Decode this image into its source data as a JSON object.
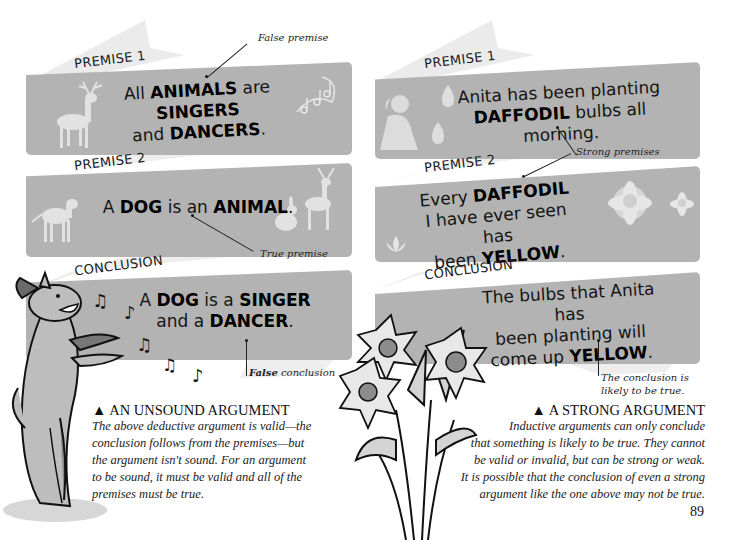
{
  "left": {
    "premise1": {
      "label": "PREMISE 1",
      "text_parts": [
        "All ",
        "ANIMALS",
        " are ",
        "SINGERS",
        "and ",
        "DANCERS",
        "."
      ],
      "annotation": "False premise"
    },
    "premise2": {
      "label": "PREMISE 2",
      "text_parts": [
        "A ",
        "DOG",
        " is an ",
        "ANIMAL",
        "."
      ],
      "annotation": "True premise"
    },
    "conclusion": {
      "label": "CONCLUSION",
      "text_parts": [
        "A ",
        "DOG",
        " is a ",
        "SINGER",
        "and a ",
        "DANCER",
        "."
      ],
      "annotation_bold": "False",
      "annotation_rest": " conclusion"
    },
    "caption": {
      "title": "▲ AN UNSOUND ARGUMENT",
      "lines": [
        "The above deductive argument is valid—the",
        "conclusion follows from the premises—but",
        "the argument isn't sound. For an argument",
        "to be sound, it must be valid and all of the",
        "premises must be true."
      ]
    }
  },
  "right": {
    "premise1": {
      "label": "PREMISE 1",
      "text_parts": [
        "Anita has been planting",
        "DAFFODIL",
        " bulbs all morning."
      ]
    },
    "premise2": {
      "label": "PREMISE 2",
      "text_parts": [
        "Every ",
        "DAFFODIL",
        "I have ever seen has",
        "been ",
        "YELLOW",
        "."
      ]
    },
    "premises_annotation": "Strong premises",
    "conclusion": {
      "label": "CONCLUSION",
      "text_parts": [
        "The bulbs that Anita has",
        "been planting will",
        "come up ",
        "YELLOW",
        "."
      ],
      "annotation_lines": [
        "The conclusion is",
        "likely to be true."
      ]
    },
    "caption": {
      "title": "▲ A STRONG ARGUMENT",
      "lines": [
        "Inductive arguments can only conclude",
        "that something is likely to be true. They cannot",
        "be valid or invalid, but can be strong or weak.",
        "It is possible that the conclusion of even a strong",
        "argument like the one above may not be true."
      ]
    }
  },
  "page_number": "89",
  "colors": {
    "banner": "#b3b3b3",
    "ribbon": "#e9e9e9",
    "silhouette": "#dcdcdc",
    "text": "#111111"
  },
  "icons": [
    "deer-icon",
    "music-notes-icon",
    "dog-icon",
    "rabbit-icon",
    "cartoon-dog-icon",
    "girl-icon",
    "bulb-icon",
    "daffodil-icon",
    "lotus-icon",
    "daffodil-bouquet-icon"
  ]
}
